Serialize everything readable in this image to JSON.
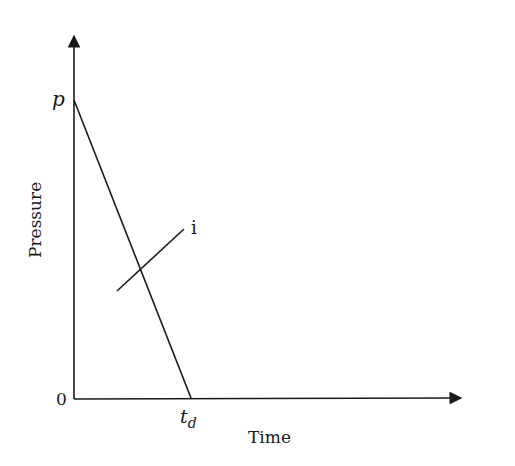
{
  "diagram": {
    "type": "pressure-time triangular pulse",
    "y_axis": {
      "label": "Pressure",
      "top_label": "p",
      "origin_label": "0"
    },
    "x_axis": {
      "label": "Time",
      "tick_label_main": "t",
      "tick_label_sub": "d"
    },
    "annotation_line": {
      "label": "i"
    },
    "colors": {
      "stroke": "#1a1a1a",
      "background": "#ffffff"
    }
  }
}
